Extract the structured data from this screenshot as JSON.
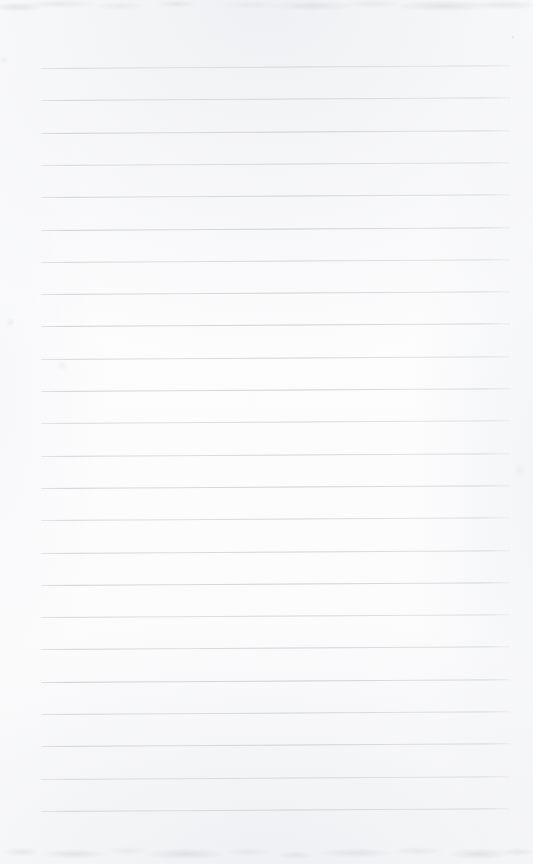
{
  "document": {
    "kind": "scanned-blank-lined-page",
    "title": "Blank ruled notebook page",
    "content_text": "",
    "visible_text": [],
    "page_number": "",
    "handwriting": "none",
    "orientation": "portrait"
  },
  "canvas": {
    "width": 533,
    "height": 864
  },
  "paper": {
    "background_color": "#fdfdfe",
    "edge_tone_color": "#e7e9ed",
    "texture": "scanned-paper-grain"
  },
  "ruling": {
    "line_color": "#c9ced4",
    "line_thickness": 1,
    "line_start_x": 41,
    "line_end_x": 510,
    "line_length": 469,
    "first_line_y": 68,
    "line_spacing": 32.3,
    "line_count": 24,
    "tilt_degrees": -0.35,
    "margin_rule": "none",
    "line_y_positions": [
      68,
      100.3,
      132.6,
      164.9,
      197.2,
      229.5,
      261.8,
      294.1,
      326.4,
      358.7,
      391,
      423.3,
      455.6,
      487.9,
      520.2,
      552.5,
      584.8,
      617.1,
      649.4,
      681.7,
      714,
      746.3,
      778.6,
      810.9
    ]
  },
  "margins": {
    "left": 41,
    "right": 23,
    "top": 68,
    "bottom": 53
  },
  "artifacts": {
    "top_noise_band_height": 26,
    "bottom_noise_band_height": 34,
    "specks": [
      {
        "x": 513,
        "y": 37,
        "size": 4,
        "opacity": 0.32
      },
      {
        "x": 10,
        "y": 322,
        "size": 9,
        "opacity": 0.18
      },
      {
        "x": 62,
        "y": 365,
        "size": 11,
        "opacity": 0.13
      },
      {
        "x": 4,
        "y": 60,
        "size": 8,
        "opacity": 0.16
      },
      {
        "x": 520,
        "y": 470,
        "size": 14,
        "opacity": 0.12
      }
    ]
  }
}
